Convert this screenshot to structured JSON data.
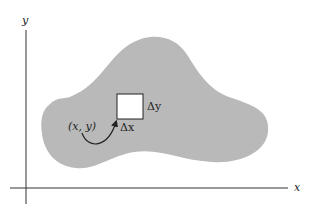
{
  "diagram": {
    "axes": {
      "x_label": "x",
      "y_label": "y"
    },
    "region": {
      "fill": "#b9b9b9",
      "element": {
        "dx_label": "Δx",
        "dy_label": "Δy",
        "point_label": "(x, y)"
      }
    }
  }
}
